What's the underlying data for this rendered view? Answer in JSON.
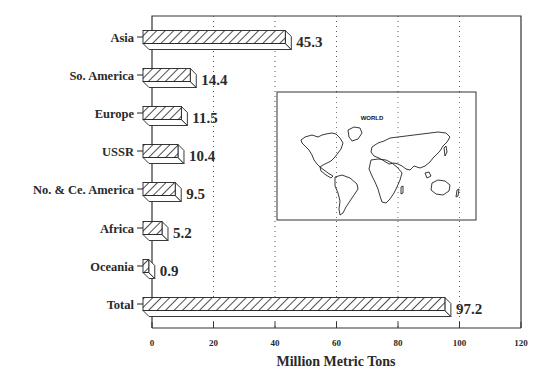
{
  "chart_data": {
    "type": "bar",
    "orientation": "horizontal",
    "style": "3d-hatched",
    "title": "",
    "xlabel": "Million Metric Tons",
    "ylabel": "",
    "categories": [
      "Asia",
      "So. America",
      "Europe",
      "USSR",
      "No. & Ce. America",
      "Africa",
      "Oceania",
      "Total"
    ],
    "values": [
      45.3,
      14.4,
      11.5,
      10.4,
      9.5,
      5.2,
      0.9,
      97.2
    ],
    "value_labels": [
      "45.3",
      "14.4",
      "11.5",
      "10.4",
      "9.5",
      "5.2",
      "0.9",
      "97.2"
    ],
    "xlim": [
      0,
      120
    ],
    "xticks": [
      0,
      20,
      40,
      60,
      80,
      100,
      120
    ],
    "xtick_labels": [
      "0",
      "20",
      "40",
      "60",
      "80",
      "100",
      "120"
    ],
    "grid": "vertical dotted",
    "legend": null,
    "inset": {
      "type": "world-map",
      "title": "WORLD"
    },
    "colors": {
      "bar_fill": "#ffffff",
      "bar_hatch": "#222222",
      "axis": "#333333",
      "grid": "#555555"
    }
  }
}
